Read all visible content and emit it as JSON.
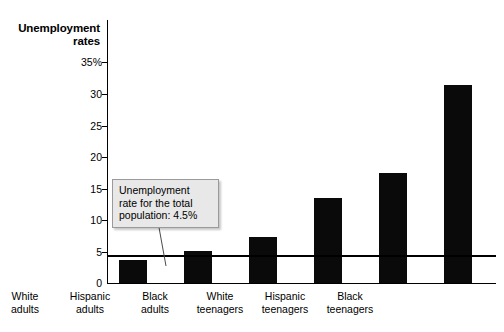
{
  "chart_data": {
    "type": "bar",
    "title": "Unemployment rates",
    "xlabel": "",
    "ylabel": "Unemployment rates",
    "ylim": [
      0,
      35
    ],
    "ytick_values": [
      0,
      5,
      10,
      15,
      20,
      25,
      30,
      35
    ],
    "ytick_labels": [
      "0",
      "5",
      "10",
      "15",
      "20",
      "25",
      "30",
      "35%"
    ],
    "grid": false,
    "legend": false,
    "categories": [
      "White adults",
      "Hispanic adults",
      "Black adults",
      "White teenagers",
      "Hispanic teenagers",
      "Black teenagers"
    ],
    "category_lines": [
      [
        "White",
        "adults"
      ],
      [
        "Hispanic",
        "adults"
      ],
      [
        "Black",
        "adults"
      ],
      [
        "White",
        "teenagers"
      ],
      [
        "Hispanic",
        "teenagers"
      ],
      [
        "Black",
        "teenagers"
      ]
    ],
    "values": [
      3.6,
      5.0,
      7.3,
      13.5,
      17.4,
      31.4
    ],
    "bar_color": "#0a0a0a",
    "reference_line": {
      "value": 4.5,
      "label": "Unemployment rate for the total population: 4.5%",
      "color": "#000000"
    },
    "annotation": {
      "lines": [
        "Unemployment",
        "rate for the total",
        "population: 4.5%"
      ],
      "text": "Unemployment rate for the total population: 4.5%",
      "background": "#e8e8e8",
      "border_color": "#9a9a9a"
    }
  },
  "title": {
    "line1": "Unemployment",
    "line2": "rates",
    "full": "Unemployment\nrates"
  },
  "axis": {
    "y_labels": [
      "35%",
      "30",
      "25",
      "20",
      "15",
      "10",
      "5",
      "0"
    ]
  },
  "annotation": {
    "line1": "Unemployment",
    "line2": "rate for the total",
    "line3": "population: 4.5%",
    "full": "Unemployment\nrate for the total\npopulation: 4.5%"
  },
  "categories": [
    {
      "full": "White adults",
      "text": "White\nadults"
    },
    {
      "full": "Hispanic adults",
      "text": "Hispanic\nadults"
    },
    {
      "full": "Black adults",
      "text": "Black\nadults"
    },
    {
      "full": "White teenagers",
      "text": "White\nteenagers"
    },
    {
      "full": "Hispanic teenagers",
      "text": "Hispanic\nteenagers"
    },
    {
      "full": "Black teenagers",
      "text": "Black\nteenagers"
    }
  ]
}
